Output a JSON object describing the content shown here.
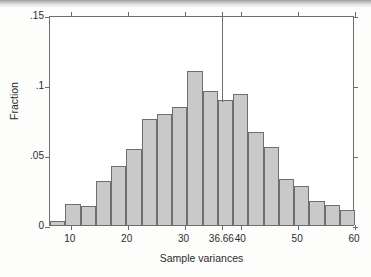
{
  "chart_data": {
    "type": "bar",
    "title": "",
    "subtitle": "",
    "xlabel": "Sample variances",
    "ylabel": "Fraction",
    "xlim": [
      6.33,
      60.0
    ],
    "ylim": [
      0,
      0.15
    ],
    "grid": false,
    "legend": null,
    "x_ticks": [
      {
        "value": 10,
        "label": "10"
      },
      {
        "value": 20,
        "label": "20"
      },
      {
        "value": 30,
        "label": "30"
      },
      {
        "value": 36.66,
        "label": "36.66"
      },
      {
        "value": 40,
        "label": "40"
      },
      {
        "value": 50,
        "label": "50"
      },
      {
        "value": 60,
        "label": "60"
      }
    ],
    "y_ticks": [
      {
        "value": 0,
        "label": "0"
      },
      {
        "value": 0.05,
        "label": ".05"
      },
      {
        "value": 0.1,
        "label": ".1"
      },
      {
        "value": 0.15,
        "label": ".15"
      }
    ],
    "bin_width": 2.685,
    "bars": [
      {
        "x0": 6.33,
        "x1": 9.02,
        "value": 0.003
      },
      {
        "x0": 9.02,
        "x1": 11.7,
        "value": 0.015
      },
      {
        "x0": 11.7,
        "x1": 14.39,
        "value": 0.0135
      },
      {
        "x0": 14.39,
        "x1": 17.07,
        "value": 0.0315
      },
      {
        "x0": 17.07,
        "x1": 19.76,
        "value": 0.042
      },
      {
        "x0": 19.76,
        "x1": 22.44,
        "value": 0.054
      },
      {
        "x0": 22.44,
        "x1": 25.13,
        "value": 0.0755
      },
      {
        "x0": 25.13,
        "x1": 27.81,
        "value": 0.0795
      },
      {
        "x0": 27.81,
        "x1": 30.5,
        "value": 0.0845
      },
      {
        "x0": 30.5,
        "x1": 33.18,
        "value": 0.11
      },
      {
        "x0": 33.18,
        "x1": 35.87,
        "value": 0.0955
      },
      {
        "x0": 35.87,
        "x1": 38.55,
        "value": 0.0895
      },
      {
        "x0": 38.55,
        "x1": 41.24,
        "value": 0.0935
      },
      {
        "x0": 41.24,
        "x1": 43.92,
        "value": 0.0665
      },
      {
        "x0": 43.92,
        "x1": 46.61,
        "value": 0.0555
      },
      {
        "x0": 46.61,
        "x1": 49.29,
        "value": 0.033
      },
      {
        "x0": 49.29,
        "x1": 51.98,
        "value": 0.028
      },
      {
        "x0": 51.98,
        "x1": 54.66,
        "value": 0.017
      },
      {
        "x0": 54.66,
        "x1": 57.35,
        "value": 0.0145
      },
      {
        "x0": 57.35,
        "x1": 60.03,
        "value": 0.0105
      }
    ],
    "reference_line": {
      "label": "36.66",
      "x": 36.66,
      "y_top": 0.15,
      "y_bottom": 0.0895,
      "orientation": "vertical"
    },
    "colors": {
      "bar_fill": "#c9c9c9",
      "bar_stroke": "#6f6f6f",
      "axis": "#6d6d6d",
      "text": "#2b2b2b",
      "background": "#ffffff"
    }
  }
}
